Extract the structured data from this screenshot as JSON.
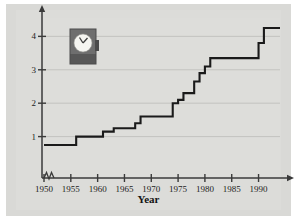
{
  "figure": {
    "background_color": "#dcdcd9",
    "plot_background_color": "#dddddA",
    "line_color": "#1a1a1a",
    "grid_color": "#b8b8b4",
    "axis_color": "#3a3a3a"
  },
  "decoration": {
    "icon_name": "punch-clock-icon",
    "body_color": "#6b6b6b",
    "base_color": "#585858",
    "face_color": "#f4f4f0"
  },
  "chart_data": {
    "type": "line",
    "subtype": "step",
    "title": "",
    "xlabel": "Year",
    "ylabel": "Minimum wage (in dollars)",
    "xlim": [
      1950,
      1994
    ],
    "ylim": [
      0,
      4.55
    ],
    "grid": true,
    "grid_axis": "y",
    "legend": "none",
    "axis_break_x": true,
    "xticks": [
      1950,
      1955,
      1960,
      1965,
      1970,
      1975,
      1980,
      1985,
      1990
    ],
    "xticklabels": [
      "1950",
      "1955",
      "1960",
      "1965",
      "1970",
      "1975",
      "1980",
      "1985",
      "1990"
    ],
    "yticks": [
      1,
      2,
      3,
      4
    ],
    "yticklabels": [
      "1",
      "2",
      "3",
      "4"
    ],
    "x": [
      1950,
      1956,
      1961,
      1963,
      1967,
      1968,
      1974,
      1975,
      1976,
      1978,
      1979,
      1980,
      1981,
      1990,
      1991,
      1994
    ],
    "values": [
      0.75,
      1.0,
      1.15,
      1.25,
      1.4,
      1.6,
      2.0,
      2.1,
      2.3,
      2.65,
      2.9,
      3.1,
      3.35,
      3.8,
      4.25,
      4.25
    ],
    "series": [
      {
        "name": "Federal minimum wage",
        "points": [
          {
            "year": 1950,
            "wage": 0.75
          },
          {
            "year": 1956,
            "wage": 1.0
          },
          {
            "year": 1961,
            "wage": 1.15
          },
          {
            "year": 1963,
            "wage": 1.25
          },
          {
            "year": 1967,
            "wage": 1.4
          },
          {
            "year": 1968,
            "wage": 1.6
          },
          {
            "year": 1974,
            "wage": 2.0
          },
          {
            "year": 1975,
            "wage": 2.1
          },
          {
            "year": 1976,
            "wage": 2.3
          },
          {
            "year": 1978,
            "wage": 2.65
          },
          {
            "year": 1979,
            "wage": 2.9
          },
          {
            "year": 1980,
            "wage": 3.1
          },
          {
            "year": 1981,
            "wage": 3.35
          },
          {
            "year": 1990,
            "wage": 3.8
          },
          {
            "year": 1991,
            "wage": 4.25
          },
          {
            "year": 1994,
            "wage": 4.25
          }
        ]
      }
    ]
  }
}
